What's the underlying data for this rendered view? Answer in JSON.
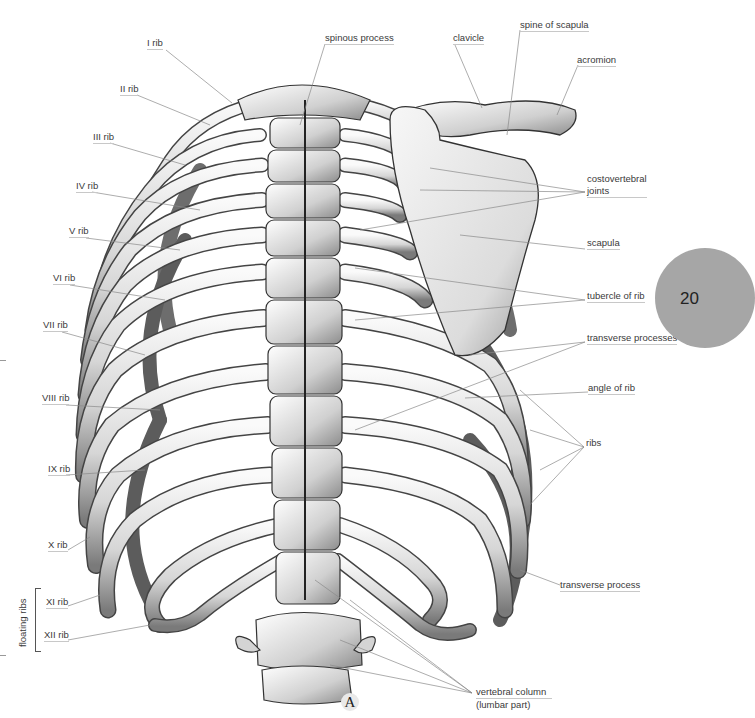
{
  "figure": {
    "letter": "A",
    "page_number": "20",
    "colors": {
      "bone_light": "#f2f2f2",
      "bone_mid": "#bdbdbd",
      "bone_dark": "#3a3a3a",
      "leader": "#8a8a8a",
      "page_circle": "#a6a6a6"
    }
  },
  "labels": {
    "left": {
      "rib_1": "I rib",
      "rib_2": "II rib",
      "rib_3": "III rib",
      "rib_4": "IV rib",
      "rib_5": "V rib",
      "rib_6": "VI rib",
      "rib_7": "VII rib",
      "rib_8": "VIII rib",
      "rib_9": "IX rib",
      "rib_10": "X rib",
      "rib_11": "XI rib",
      "rib_12": "XII rib",
      "floating_ribs": "floating ribs"
    },
    "top": {
      "spinous_process": "spinous process",
      "clavicle": "clavicle",
      "spine_of_scapula": "spine of scapula",
      "acromion": "acromion"
    },
    "right": {
      "costovertebral_line1": "costovertebral",
      "costovertebral_line2": "joints",
      "scapula": "scapula",
      "tubercle_of_rib": "tubercle of rib",
      "transverse_processes": "transverse processes",
      "angle_of_rib": "angle of rib",
      "ribs": "ribs",
      "transverse_process": "transverse process"
    },
    "bottom": {
      "vertebral_column_line1": "vertebral column",
      "vertebral_column_line2": "(lumbar part)"
    }
  }
}
